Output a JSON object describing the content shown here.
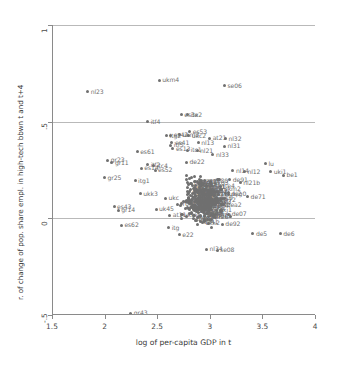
{
  "chart_data": {
    "type": "scatter",
    "title": "",
    "xlabel": "log of per-capita GDP in t",
    "ylabel": "r. of change of pop. share empl. in high-tech bbwn t and t+4",
    "xlim": [
      1.5,
      4
    ],
    "ylim": [
      -0.5,
      1
    ],
    "xticks": [
      "1.5",
      "2",
      "2.5",
      "3",
      "3.5",
      "4"
    ],
    "xtick_values": [
      1.5,
      2,
      2.5,
      3,
      3.5,
      4
    ],
    "yticks": [
      "1",
      ".5",
      "0",
      "-.5"
    ],
    "ytick_values": [
      1,
      0.5,
      0,
      -0.5
    ],
    "grid": "horizontal",
    "legend": "none",
    "marker_color": "#707070",
    "label_color": "#6f6f6f",
    "grid_color": "#b9b9b9",
    "axis_color": "#8a8a8a",
    "points": [
      {
        "label": "ukm4",
        "x": 2.51,
        "y": 0.715
      },
      {
        "label": "se06",
        "x": 3.13,
        "y": 0.685
      },
      {
        "label": "nl23",
        "x": 1.83,
        "y": 0.655
      },
      {
        "label": "es3x",
        "x": 2.72,
        "y": 0.535
      },
      {
        "label": "ite2",
        "x": 2.78,
        "y": 0.535
      },
      {
        "label": "itf4",
        "x": 2.4,
        "y": 0.5
      },
      {
        "label": "es53",
        "x": 2.8,
        "y": 0.448
      },
      {
        "label": "ukm3",
        "x": 2.7,
        "y": 0.432
      },
      {
        "label": "ukc2",
        "x": 2.79,
        "y": 0.428
      },
      {
        "label": "es42",
        "x": 2.62,
        "y": 0.43
      },
      {
        "label": "itg2",
        "x": 2.58,
        "y": 0.428
      },
      {
        "label": "at21",
        "x": 2.99,
        "y": 0.415
      },
      {
        "label": "nl32",
        "x": 3.14,
        "y": 0.412
      },
      {
        "label": "es41",
        "x": 2.63,
        "y": 0.392
      },
      {
        "label": "itf5",
        "x": 2.62,
        "y": 0.378
      },
      {
        "label": "nl13",
        "x": 2.88,
        "y": 0.39
      },
      {
        "label": "nl31",
        "x": 3.13,
        "y": 0.372
      },
      {
        "label": "es13",
        "x": 2.64,
        "y": 0.36
      },
      {
        "label": "es61",
        "x": 2.3,
        "y": 0.345
      },
      {
        "label": "itc1",
        "x": 2.78,
        "y": 0.352
      },
      {
        "label": "nl21",
        "x": 2.87,
        "y": 0.35
      },
      {
        "label": "nl33",
        "x": 3.02,
        "y": 0.33
      },
      {
        "label": "gr23",
        "x": 2.02,
        "y": 0.3
      },
      {
        "label": "gr11",
        "x": 2.06,
        "y": 0.288
      },
      {
        "label": "itf2",
        "x": 2.4,
        "y": 0.278
      },
      {
        "label": "itc4",
        "x": 2.46,
        "y": 0.272
      },
      {
        "label": "de22",
        "x": 2.77,
        "y": 0.29
      },
      {
        "label": "lu",
        "x": 3.52,
        "y": 0.282
      },
      {
        "label": "es14",
        "x": 2.34,
        "y": 0.258
      },
      {
        "label": "es52",
        "x": 2.47,
        "y": 0.248
      },
      {
        "label": "uki1",
        "x": 3.57,
        "y": 0.24
      },
      {
        "label": "nl14",
        "x": 3.21,
        "y": 0.245
      },
      {
        "label": "nl12",
        "x": 3.32,
        "y": 0.24
      },
      {
        "label": "be1",
        "x": 3.69,
        "y": 0.222
      },
      {
        "label": "gr25",
        "x": 1.99,
        "y": 0.21
      },
      {
        "label": "itg1",
        "x": 2.28,
        "y": 0.195
      },
      {
        "label": "de91",
        "x": 3.18,
        "y": 0.2
      },
      {
        "label": "nl21b",
        "x": 3.28,
        "y": 0.185
      },
      {
        "label": "ukk3",
        "x": 2.33,
        "y": 0.128
      },
      {
        "label": "ukc",
        "x": 2.57,
        "y": 0.105
      },
      {
        "label": "de71",
        "x": 3.35,
        "y": 0.112
      },
      {
        "label": "es43",
        "x": 2.08,
        "y": 0.06
      },
      {
        "label": "uk45",
        "x": 2.48,
        "y": 0.048
      },
      {
        "label": "gr14",
        "x": 2.12,
        "y": 0.042
      },
      {
        "label": "de07",
        "x": 3.17,
        "y": 0.02
      },
      {
        "label": "at11",
        "x": 2.61,
        "y": 0.015
      },
      {
        "label": "es62",
        "x": 2.15,
        "y": -0.035
      },
      {
        "label": "de92",
        "x": 3.11,
        "y": -0.03
      },
      {
        "label": "itg",
        "x": 2.6,
        "y": -0.048
      },
      {
        "label": "e22",
        "x": 2.7,
        "y": -0.085
      },
      {
        "label": "de5",
        "x": 3.4,
        "y": -0.08
      },
      {
        "label": "de6",
        "x": 3.66,
        "y": -0.08
      },
      {
        "label": "nl34",
        "x": 2.96,
        "y": -0.16
      },
      {
        "label": "se08",
        "x": 3.06,
        "y": -0.165
      },
      {
        "label": "gr43",
        "x": 2.24,
        "y": -0.49
      }
    ],
    "cluster_note": "dense unlabeled cluster of European NUTS regions centered near x=2.9, y=0.10"
  },
  "axis": {
    "x_label": "log of per-capita GDP in t",
    "y_label": "r. of change of pop. share empl. in high-tech bbwn t and t+4"
  }
}
